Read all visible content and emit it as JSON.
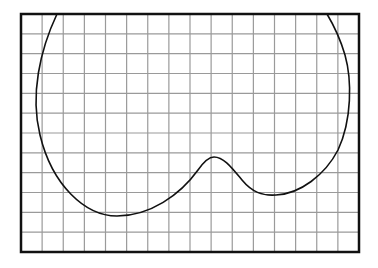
{
  "diagram": {
    "type": "closed-curve-on-grid",
    "frame": {
      "x": 21,
      "y": 14,
      "width": 338,
      "height": 238,
      "stroke": "#111111",
      "stroke_width": 2.5
    },
    "grid": {
      "columns": 16,
      "rows": 12,
      "color": "#9a9a9a",
      "stroke_width": 1.2
    },
    "curve": {
      "color": "#111111",
      "stroke_width": 1.6,
      "path": "M 57 14 C 40 50, 30 95, 40 135 C 52 185, 85 216, 117 216 C 150 216, 180 195, 198 170 C 205 160, 210 157, 214 157 C 224 157, 232 168, 242 180 C 252 192, 262 196, 276 195 C 300 194, 325 175, 338 150 C 352 120, 352 80, 345 55 C 340 38, 333 24, 327 14"
    },
    "key_points": {
      "left_extreme": [
        35,
        113
      ],
      "bottom_minimum": [
        117,
        216
      ],
      "bump_peak": [
        213,
        157
      ],
      "second_dip": [
        275,
        195
      ],
      "right_extreme": [
        350,
        92
      ]
    }
  }
}
